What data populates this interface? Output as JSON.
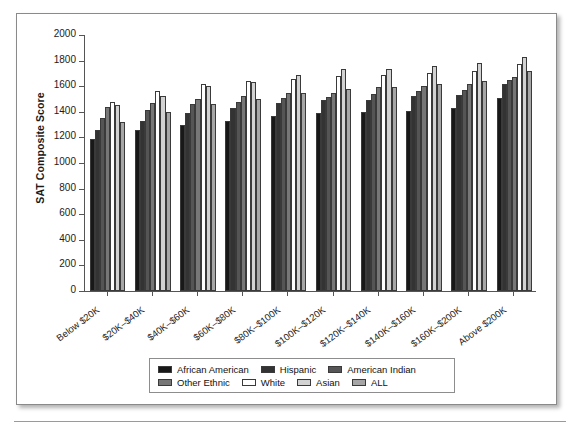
{
  "figure": {
    "y_axis_title": "SAT Composite Score"
  },
  "chart_data": {
    "type": "bar",
    "title": "",
    "xlabel": "",
    "ylabel": "SAT Composite Score",
    "ylim": [
      0,
      2000
    ],
    "ytick_values": [
      0,
      200,
      400,
      600,
      800,
      1000,
      1200,
      1400,
      1600,
      1800,
      2000
    ],
    "ytick_labels": [
      "0",
      "200",
      "400",
      "600",
      "800",
      "1000",
      "1200",
      "1400",
      "1600",
      "1800",
      "2000"
    ],
    "grid": false,
    "legend_position": "bottom",
    "categories": [
      "Below $20K",
      "$20K–$40K",
      "$40K–$60K",
      "$60K–$80K",
      "$80K–$100K",
      "$100K–$120K",
      "$120K–$140K",
      "$140K–$160K",
      "$160K–$200K",
      "Above $200K"
    ],
    "series": [
      {
        "name": "African American",
        "color": "#181818",
        "values": [
          1190,
          1255,
          1300,
          1330,
          1370,
          1390,
          1400,
          1405,
          1430,
          1510
        ]
      },
      {
        "name": "Hispanic",
        "color": "#333333",
        "values": [
          1255,
          1330,
          1390,
          1430,
          1470,
          1490,
          1490,
          1520,
          1530,
          1620
        ]
      },
      {
        "name": "American Indian",
        "color": "#555555",
        "values": [
          1350,
          1415,
          1460,
          1480,
          1505,
          1515,
          1540,
          1560,
          1570,
          1650
        ]
      },
      {
        "name": "Other Ethnic",
        "color": "#777777",
        "values": [
          1435,
          1470,
          1500,
          1525,
          1545,
          1545,
          1595,
          1600,
          1620,
          1670
        ]
      },
      {
        "name": "White",
        "color": "#ffffff",
        "values": [
          1480,
          1560,
          1615,
          1640,
          1660,
          1680,
          1690,
          1705,
          1720,
          1770
        ]
      },
      {
        "name": "Asian",
        "color": "#d2d2d2",
        "values": [
          1450,
          1520,
          1600,
          1635,
          1685,
          1735,
          1735,
          1755,
          1785,
          1830
        ]
      },
      {
        "name": "ALL",
        "color": "#a6a6a6",
        "values": [
          1320,
          1400,
          1460,
          1500,
          1545,
          1580,
          1595,
          1620,
          1640,
          1715
        ]
      }
    ]
  },
  "legend": {
    "row1": [
      "African American",
      "Hispanic",
      "American Indian"
    ],
    "row2": [
      "Other Ethnic",
      "White",
      "Asian",
      "ALL"
    ]
  }
}
